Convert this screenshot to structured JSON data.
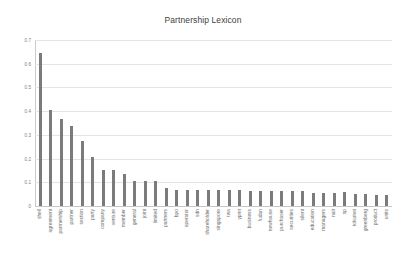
{
  "chart_data": {
    "type": "bar",
    "title": "Partnership Lexicon",
    "xlabel": "",
    "ylabel": "",
    "ylim": [
      0,
      0.7
    ],
    "ytick_labels": [
      "0.7",
      "0.6",
      "0.5",
      "0.4",
      "0.3",
      "0.2",
      "0.1",
      "0"
    ],
    "ytick_values": [
      0.7,
      0.6,
      0.5,
      0.4,
      0.3,
      0.2,
      0.1,
      0
    ],
    "grid": true,
    "legend": "none",
    "bar_color": "#7b7b7b",
    "categories": [
      "shell",
      "agreement",
      "partnership",
      "partner",
      "section",
      "party",
      "company",
      "venture",
      "member",
      "general",
      "joint",
      "limited",
      "partners",
      "bpo",
      "operator",
      "sdn",
      "shareholder",
      "singapore",
      "twa",
      "ypmt",
      "business",
      "fudan",
      "newhouse",
      "purchaser",
      "securities",
      "silent",
      "education",
      "managers",
      "nait",
      "sp",
      "tokumei",
      "greenberg",
      "product",
      "units"
    ],
    "values": [
      0.645,
      0.405,
      0.367,
      0.338,
      0.276,
      0.206,
      0.152,
      0.153,
      0.135,
      0.105,
      0.104,
      0.105,
      0.076,
      0.069,
      0.069,
      0.069,
      0.069,
      0.069,
      0.066,
      0.066,
      0.062,
      0.062,
      0.062,
      0.062,
      0.062,
      0.063,
      0.055,
      0.055,
      0.055,
      0.057,
      0.05,
      0.049,
      0.047,
      0.047
    ]
  }
}
